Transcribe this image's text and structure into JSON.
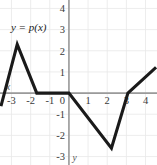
{
  "chart_data": {
    "type": "line",
    "title": "",
    "subtitle": "",
    "xlabel": "x",
    "ylabel": "y",
    "xlim": [
      -3.6,
      4.6
    ],
    "ylim": [
      -3.4,
      4.4
    ],
    "grid": true,
    "grid_step": 1,
    "legend": "none",
    "annotations": [
      {
        "text": "y = p(x)",
        "x": -2.1,
        "y": 2.95
      }
    ],
    "xticks": [
      -3,
      -2,
      -1,
      0,
      1,
      2,
      3,
      4
    ],
    "xtick_labels": [
      "-3",
      "-2",
      "-1",
      "0",
      "1",
      "2",
      "3",
      "4"
    ],
    "yticks": [
      -3,
      -2,
      -1,
      1,
      2,
      3,
      4
    ],
    "ytick_labels": [
      "-3",
      "-2",
      "-1",
      "1",
      "2",
      "3",
      "4"
    ],
    "origin_label": "0",
    "series": [
      {
        "name": "p(x)",
        "kind": "piecewise-linear",
        "points": [
          {
            "x": -3.55,
            "y": -0.62
          },
          {
            "x": -2.7,
            "y": 2.3
          },
          {
            "x": -1.68,
            "y": 0.0
          },
          {
            "x": 0.0,
            "y": 0.0
          },
          {
            "x": 2.22,
            "y": -2.6
          },
          {
            "x": 3.08,
            "y": 0.0
          },
          {
            "x": 4.55,
            "y": 1.22
          }
        ]
      }
    ]
  },
  "labels": {
    "x_axis_name": "x",
    "y_axis_name": "y",
    "function_label": "y = p(x)"
  },
  "colors": {
    "curve": "#1a1a1a",
    "axis": "#9a9a9a",
    "grid": "#e9e9e9",
    "text": "#3a3a3a",
    "background": "#ffffff"
  }
}
